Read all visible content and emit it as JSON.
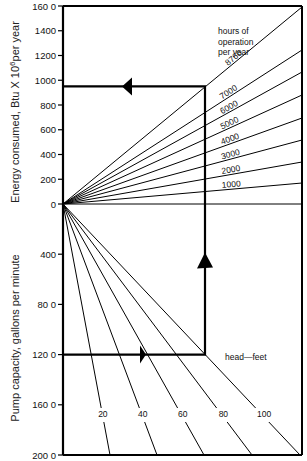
{
  "chart_data": {
    "type": "line",
    "upper_panel": {
      "ylabel": "Energy consumed, Btu X 10^6 per year",
      "ylabel_main": "Energy consumed, Btu X 10",
      "ylabel_sup": "6",
      "ylabel_tail": "per year",
      "ylim": [
        0,
        1600
      ],
      "ticks": [
        0,
        200,
        400,
        600,
        800,
        1000,
        1200,
        1400,
        1600
      ],
      "tick_labels": [
        "0",
        "200",
        "400",
        "600",
        "800",
        "1000",
        "1200",
        "1400",
        "160 0"
      ],
      "legend_title": [
        "hours of",
        "operation",
        "per year"
      ],
      "series": [
        {
          "name": "8760",
          "end_y_px": 7
        },
        {
          "name": "7000",
          "end_y_px": 50
        },
        {
          "name": "6000",
          "end_y_px": 72
        },
        {
          "name": "5000",
          "end_y_px": 95
        },
        {
          "name": "4000",
          "end_y_px": 118
        },
        {
          "name": "3000",
          "end_y_px": 140
        },
        {
          "name": "2000",
          "end_y_px": 162
        },
        {
          "name": "1000",
          "end_y_px": 183
        }
      ]
    },
    "lower_panel": {
      "ylabel": "Pump capacity, gallons per minute",
      "ylim": [
        0,
        2000
      ],
      "ticks": [
        400,
        800,
        1200,
        1600,
        2000
      ],
      "tick_labels": [
        "400",
        "80 0",
        "120 0",
        "160 0",
        "200 0"
      ],
      "legend_title": "head—feet",
      "series": [
        {
          "name": "20",
          "end_x_px": 110
        },
        {
          "name": "40",
          "end_x_px": 157
        },
        {
          "name": "60",
          "end_x_px": 204
        },
        {
          "name": "80",
          "end_x_px": 252
        },
        {
          "name": "100",
          "end_x_px": 300
        }
      ]
    },
    "example_solution": {
      "pump_capacity_gpm": 1200,
      "head_feet": 70,
      "hours_per_year": 8760,
      "energy_btu_1e6_per_year": 950
    },
    "grid": false
  }
}
